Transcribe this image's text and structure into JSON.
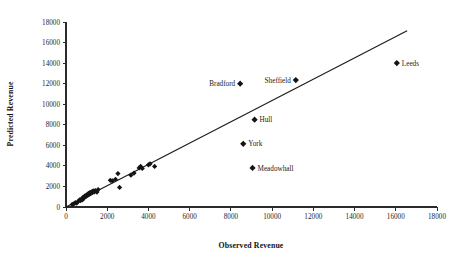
{
  "chart_data": {
    "type": "scatter",
    "title": "",
    "xlabel": "Observed Revenue",
    "ylabel": "Predicted Revenue",
    "xlim": [
      0,
      18000
    ],
    "ylim": [
      0,
      18000
    ],
    "xticks": [
      0,
      2000,
      4000,
      6000,
      8000,
      10000,
      12000,
      14000,
      16000,
      18000
    ],
    "yticks": [
      0,
      2000,
      4000,
      6000,
      8000,
      10000,
      12000,
      14000,
      16000,
      18000
    ],
    "xtick_labels": [
      "0",
      "2000",
      "4000",
      "6000",
      "8000",
      "10000",
      "12000",
      "14000",
      "16000",
      "18000"
    ],
    "ytick_labels": [
      "0",
      "2000",
      "4000",
      "6000",
      "8000",
      "10000",
      "12000",
      "14000",
      "16000",
      "18000"
    ],
    "grid": false,
    "legend": false,
    "marker_style": "filled-diamond",
    "marker_color": "#141414",
    "fit_line": {
      "label": "",
      "color": "#1b1b1b",
      "x_start": 0,
      "y_start": 0,
      "x_end": 16550,
      "y_end": 17150
    },
    "labeled_points": [
      {
        "label": "Bradford",
        "x": 8450,
        "y": 12000,
        "label_side": "left"
      },
      {
        "label": "Sheffield",
        "x": 11150,
        "y": 12350,
        "label_side": "left"
      },
      {
        "label": "Hull",
        "x": 9150,
        "y": 8500,
        "label_side": "right"
      },
      {
        "label": "York",
        "x": 8600,
        "y": 6150,
        "label_side": "right"
      },
      {
        "label": "Meadowhall",
        "x": 9050,
        "y": 3800,
        "label_side": "right"
      },
      {
        "label": "Leeds",
        "x": 16050,
        "y": 14000,
        "label_side": "right"
      }
    ],
    "points": [
      {
        "x": 300,
        "y": 250
      },
      {
        "x": 380,
        "y": 300
      },
      {
        "x": 450,
        "y": 420
      },
      {
        "x": 520,
        "y": 380
      },
      {
        "x": 600,
        "y": 560
      },
      {
        "x": 660,
        "y": 700
      },
      {
        "x": 700,
        "y": 620
      },
      {
        "x": 760,
        "y": 800
      },
      {
        "x": 800,
        "y": 700
      },
      {
        "x": 830,
        "y": 950
      },
      {
        "x": 880,
        "y": 880
      },
      {
        "x": 900,
        "y": 1050
      },
      {
        "x": 950,
        "y": 1000
      },
      {
        "x": 980,
        "y": 1150
      },
      {
        "x": 1010,
        "y": 1080
      },
      {
        "x": 1050,
        "y": 1250
      },
      {
        "x": 1080,
        "y": 1180
      },
      {
        "x": 1100,
        "y": 1320
      },
      {
        "x": 1140,
        "y": 1240
      },
      {
        "x": 1160,
        "y": 1400
      },
      {
        "x": 1190,
        "y": 1300
      },
      {
        "x": 1220,
        "y": 1450
      },
      {
        "x": 1250,
        "y": 1380
      },
      {
        "x": 1280,
        "y": 1520
      },
      {
        "x": 1300,
        "y": 1420
      },
      {
        "x": 1340,
        "y": 1560
      },
      {
        "x": 1380,
        "y": 1480
      },
      {
        "x": 1420,
        "y": 1600
      },
      {
        "x": 1500,
        "y": 1450
      },
      {
        "x": 1560,
        "y": 1700
      },
      {
        "x": 2150,
        "y": 2600
      },
      {
        "x": 2250,
        "y": 2550
      },
      {
        "x": 2400,
        "y": 2700
      },
      {
        "x": 2520,
        "y": 3250
      },
      {
        "x": 2600,
        "y": 1900
      },
      {
        "x": 3150,
        "y": 3100
      },
      {
        "x": 3300,
        "y": 3300
      },
      {
        "x": 3550,
        "y": 3800
      },
      {
        "x": 3620,
        "y": 3950
      },
      {
        "x": 3700,
        "y": 3750
      },
      {
        "x": 4000,
        "y": 4100
      },
      {
        "x": 4080,
        "y": 4200
      },
      {
        "x": 4300,
        "y": 3950
      }
    ]
  }
}
